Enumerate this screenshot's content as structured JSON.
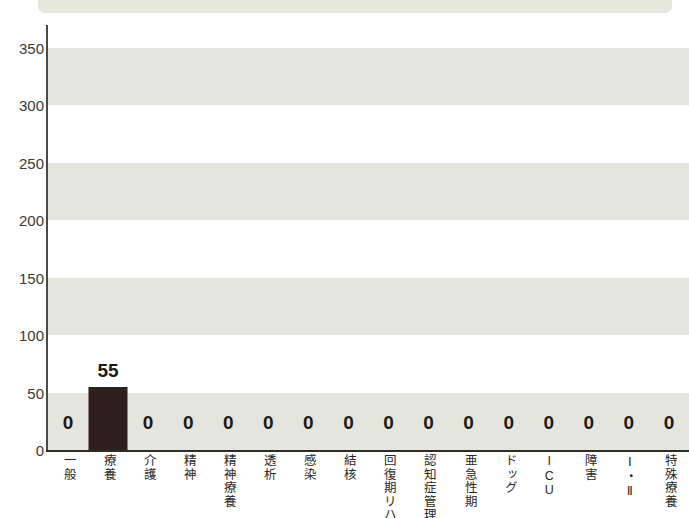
{
  "chart_data": {
    "type": "bar",
    "title": "",
    "subtitle": "",
    "xlabel": "",
    "ylabel": "",
    "ylim": [
      0,
      370
    ],
    "yticks": [
      0,
      50,
      100,
      150,
      200,
      250,
      300,
      350
    ],
    "grid": "alternating-horizontal-bands",
    "legend": "none",
    "bar_color": "#2e201c",
    "band_color": "#e4e5dc",
    "banded_ranges": [
      [
        0,
        50
      ],
      [
        100,
        150
      ],
      [
        200,
        250
      ],
      [
        300,
        350
      ]
    ],
    "categories": [
      "一般",
      "療養",
      "介護",
      "精神",
      "精神療養",
      "透析",
      "感染",
      "結核",
      "回復期リハ",
      "認知症管理",
      "亜急性期",
      "ドッグ",
      "ICU",
      "障害",
      "Ⅰ・Ⅱ",
      "特殊療養"
    ],
    "values": [
      0,
      55,
      0,
      0,
      0,
      0,
      0,
      0,
      0,
      0,
      0,
      0,
      0,
      0,
      0,
      0
    ],
    "value_labels": [
      "0",
      "55",
      "0",
      "0",
      "0",
      "0",
      "0",
      "0",
      "0",
      "0",
      "0",
      "0",
      "0",
      "0",
      "0",
      "0"
    ]
  },
  "banner": {
    "color": "#e6e7dd"
  }
}
